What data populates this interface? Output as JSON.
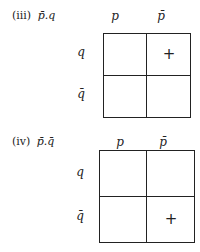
{
  "diagrams": [
    {
      "numeral": "(iii)",
      "expression": "p̄.q",
      "column_headers": [
        "p",
        "p̄"
      ],
      "row_headers": [
        "q",
        "q̄"
      ],
      "cells": [
        [
          "",
          "+"
        ],
        [
          "",
          ""
        ]
      ]
    },
    {
      "numeral": "(iv)",
      "expression": "p̄.q̄",
      "column_headers": [
        "p",
        "p̄"
      ],
      "row_headers": [
        "q",
        "q̄"
      ],
      "cells": [
        [
          "",
          ""
        ],
        [
          "",
          "+"
        ]
      ]
    }
  ]
}
